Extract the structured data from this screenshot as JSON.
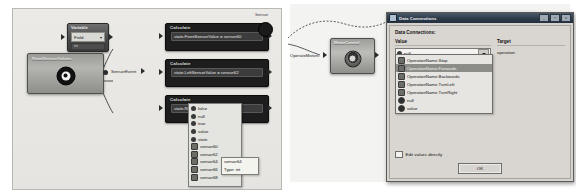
{
  "left_panel": {
    "variable_node": {
      "title": "Variable",
      "field_label": "Field",
      "type_label": "int",
      "dropdown_icon": "chevron-down-icon"
    },
    "sensor_node": {
      "title": "ReadSensorValues",
      "icon": "sensor-eye-icon",
      "output_label": "SensorEvent"
    },
    "calculate_nodes": [
      {
        "title": "Calculate",
        "expression": "state.FrontSensorValue = sensor60"
      },
      {
        "title": "Calculate",
        "expression": "state.LeftSensorValue = sensor62"
      },
      {
        "title": "Calculate",
        "expression": "state.RightSensorValue = sensor64"
      }
    ],
    "autocomplete": {
      "items": [
        {
          "label": "false",
          "icon": "keyword-dot-icon"
        },
        {
          "label": "null",
          "icon": "keyword-dot-icon"
        },
        {
          "label": "true",
          "icon": "keyword-dot-icon"
        },
        {
          "label": "value",
          "icon": "keyword-dot-icon"
        },
        {
          "label": "state",
          "icon": "keyword-dot-icon"
        },
        {
          "label": "sensor60",
          "icon": "field-square-icon"
        },
        {
          "label": "sensor62",
          "icon": "field-square-icon"
        },
        {
          "label": "sensor64",
          "icon": "field-square-icon"
        },
        {
          "label": "sensor66",
          "icon": "field-square-icon"
        },
        {
          "label": "sensor68",
          "icon": "field-square-icon"
        }
      ]
    },
    "tooltip": {
      "name": "sensor64",
      "type": "Type: int"
    }
  },
  "right_panel": {
    "start_node_caption": "Sensor",
    "motor_node": {
      "title": "MotorControl",
      "icon": "motor-gear-icon",
      "input_label": "OperateMotors"
    },
    "dialog": {
      "title": "Data Connections",
      "title_icon": "window-icon",
      "window_buttons": [
        "_",
        "□",
        "x"
      ],
      "section_label": "Data Connections:",
      "columns": {
        "value": "Value",
        "target": "Target"
      },
      "value_selected": "null",
      "value_icon": "keyword-dot-icon",
      "dropdown_arrow_icon": "chevron-down-icon",
      "target_value": "operation",
      "options": [
        {
          "label": "OperationName.Stop",
          "icon": "enum-icon",
          "selected": false
        },
        {
          "label": "OperationName.Forwards",
          "icon": "enum-icon",
          "selected": true
        },
        {
          "label": "OperationName.Backwards",
          "icon": "enum-icon",
          "selected": false
        },
        {
          "label": "OperationName.TurnLeft",
          "icon": "enum-icon",
          "selected": false
        },
        {
          "label": "OperationName.TurnRight",
          "icon": "enum-icon",
          "selected": false
        },
        {
          "label": "null",
          "icon": "keyword-dot-icon",
          "selected": false
        },
        {
          "label": "value",
          "icon": "keyword-dot-icon",
          "selected": false
        }
      ],
      "edit_values_label": "Edit values directly",
      "edit_values_checked": false,
      "ok_label": "OK"
    }
  }
}
